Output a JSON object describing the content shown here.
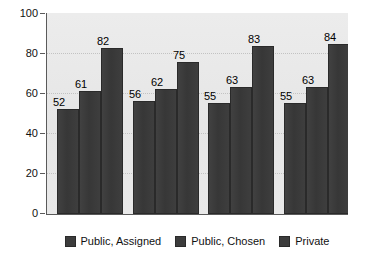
{
  "chart_data": {
    "type": "bar",
    "title": "",
    "subtitle": "",
    "xlabel": "",
    "ylabel": "",
    "ylim": [
      0,
      100
    ],
    "ytick_labels": [
      "0",
      "20",
      "40",
      "60",
      "80",
      "100"
    ],
    "ytick_values": [
      0,
      20,
      40,
      60,
      80,
      100
    ],
    "categories": [
      "Group 1",
      "Group 2",
      "Group 3",
      "Group 4"
    ],
    "category_labels_visible": false,
    "grid": "horizontal-dotted",
    "legend_position": "bottom-center",
    "series": [
      {
        "name": "Public, Assigned",
        "values": [
          52,
          56,
          55,
          55
        ],
        "color": "#3c3c3c"
      },
      {
        "name": "Public, Chosen",
        "values": [
          61,
          62,
          63,
          63
        ],
        "color": "#3c3c3c"
      },
      {
        "name": "Private",
        "values": [
          82,
          75,
          83,
          84
        ],
        "color": "#3c3c3c"
      }
    ],
    "data_labels": [
      [
        "52",
        "61",
        "82"
      ],
      [
        "56",
        "62",
        "75"
      ],
      [
        "55",
        "63",
        "83"
      ],
      [
        "55",
        "63",
        "84"
      ]
    ],
    "colors": {
      "plot_background": "#e9e9e9",
      "page_background": "#ffffff",
      "bar": "#3c3c3c",
      "axis": "#5a5a5a",
      "gridline": "#c2c2c2",
      "text": "#111111"
    }
  },
  "legend": {
    "items": [
      {
        "label": "Public, Assigned"
      },
      {
        "label": "Public, Chosen"
      },
      {
        "label": "Private"
      }
    ]
  }
}
